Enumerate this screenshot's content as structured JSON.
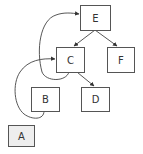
{
  "diagram": {
    "type": "directed-graph",
    "nodes": [
      {
        "id": "E",
        "label": "E",
        "x": 80,
        "y": 5,
        "w": 30,
        "h": 25,
        "fill": "#ffffff"
      },
      {
        "id": "C",
        "label": "C",
        "x": 56,
        "y": 47,
        "w": 28,
        "h": 25,
        "fill": "#ffffff"
      },
      {
        "id": "F",
        "label": "F",
        "x": 107,
        "y": 47,
        "w": 27,
        "h": 25,
        "fill": "#ffffff"
      },
      {
        "id": "B",
        "label": "B",
        "x": 31,
        "y": 87,
        "w": 28,
        "h": 24,
        "fill": "#ffffff"
      },
      {
        "id": "D",
        "label": "D",
        "x": 81,
        "y": 87,
        "w": 28,
        "h": 24,
        "fill": "#ffffff"
      },
      {
        "id": "A",
        "label": "A",
        "x": 8,
        "y": 125,
        "w": 26,
        "h": 21,
        "fill": "#eeeeee"
      }
    ],
    "edges": [
      {
        "from": "E",
        "to": "C",
        "style": "straight"
      },
      {
        "from": "E",
        "to": "F",
        "style": "straight"
      },
      {
        "from": "C",
        "to": "D",
        "style": "straight"
      },
      {
        "from": "C",
        "to": "E",
        "style": "curved"
      },
      {
        "from": "B",
        "to": "C",
        "style": "curved"
      }
    ]
  }
}
